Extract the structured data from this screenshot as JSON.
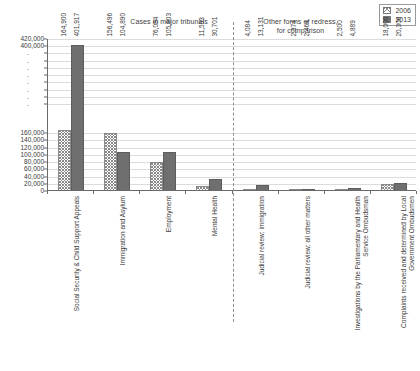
{
  "titles": {
    "left": "Cases in major tribunals",
    "right_line1": "Other forms of redress,",
    "right_line2": "for comparison"
  },
  "legend": {
    "position": "top-right",
    "items": [
      {
        "label": "2006",
        "swatch": "hatched-swatch",
        "color": "#ffffff"
      },
      {
        "label": "2013",
        "swatch": "solid-swatch",
        "color": "#6f6f6f"
      }
    ]
  },
  "chart_data": {
    "type": "bar",
    "xlabel": "",
    "ylabel": "",
    "ylim": [
      0,
      420000
    ],
    "grid": true,
    "legend_position": "top-right",
    "categories": [
      "Social Security & Child Support Appeals",
      "Immigration and Asylum",
      "Employment",
      "Mental Health",
      "Judicial review: immigration",
      "Judicial review: all other matters",
      "Investigations by the Parliamentary and Health Service Ombudsman",
      "Complaints received and determined by Local Government Ombudsmen"
    ],
    "series": [
      {
        "name": "2006",
        "values": [
          164900,
          156496,
          76084,
          11553,
          4084,
          2374,
          2500,
          18000
        ],
        "labels": [
          "164,900",
          "156,496",
          "76,084",
          "11,553",
          "4,084",
          "2,374",
          "2,500",
          "18,000"
        ]
      },
      {
        "name": "2013",
        "values": [
          401917,
          104890,
          105803,
          30701,
          13131,
          2464,
          4889,
          20306
        ],
        "labels": [
          "401,917",
          "104,890",
          "105,803",
          "30,701",
          "13,131",
          "2,464",
          "4,889",
          "20,306"
        ]
      }
    ],
    "ytick_labels": [
      "420,000",
      "400,000",
      ".",
      ".",
      ".",
      ".",
      ".",
      ".",
      ".",
      ".",
      "160,000",
      "140,000",
      "120,000",
      "100,000",
      "80,000",
      "60,000",
      "40,000",
      "20,000",
      "0"
    ],
    "ytick_values": [
      420000,
      400000,
      380000,
      360000,
      340000,
      320000,
      300000,
      280000,
      260000,
      240000,
      160000,
      140000,
      120000,
      100000,
      80000,
      60000,
      40000,
      20000,
      0
    ],
    "panel_divider_after_category_index": 3
  }
}
